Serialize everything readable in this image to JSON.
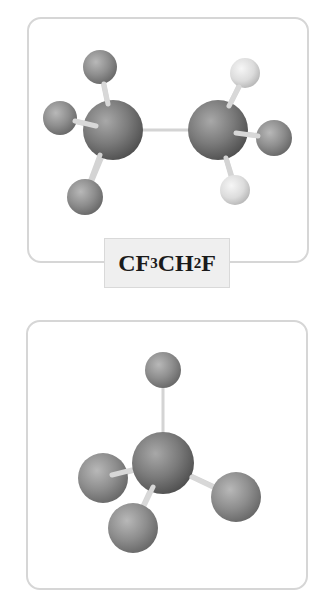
{
  "figure": {
    "panels": [
      {
        "id": "panel1",
        "label": {
          "parts": [
            {
              "text": "CF",
              "sub": "3"
            },
            {
              "text": "CH",
              "sub": "2"
            },
            {
              "text": "F",
              "sub": ""
            }
          ],
          "full_text": "CF3CH2F"
        },
        "molecule": "CF3CH2F",
        "atoms": [
          {
            "element": "C",
            "x": 113,
            "y": 130,
            "r": 30
          },
          {
            "element": "F",
            "x": 100,
            "y": 67,
            "r": 17
          },
          {
            "element": "F",
            "x": 60,
            "y": 118,
            "r": 17
          },
          {
            "element": "F",
            "x": 85,
            "y": 197,
            "r": 18
          },
          {
            "element": "C",
            "x": 218,
            "y": 130,
            "r": 30
          },
          {
            "element": "H",
            "x": 245,
            "y": 73,
            "r": 15
          },
          {
            "element": "F",
            "x": 274,
            "y": 138,
            "r": 18
          },
          {
            "element": "H",
            "x": 235,
            "y": 190,
            "r": 15
          }
        ]
      },
      {
        "id": "panel2",
        "molecule": "CF4",
        "atoms": [
          {
            "element": "F",
            "x": 163,
            "y": 370,
            "r": 18
          },
          {
            "element": "C",
            "x": 163,
            "y": 463,
            "r": 31
          },
          {
            "element": "F",
            "x": 103,
            "y": 478,
            "r": 25
          },
          {
            "element": "F",
            "x": 236,
            "y": 497,
            "r": 25
          },
          {
            "element": "F",
            "x": 133,
            "y": 528,
            "r": 25
          }
        ]
      }
    ],
    "colors": {
      "carbon": "#7a7a7a",
      "fluorine": "#8e8e8e",
      "hydrogen": "#dcdcdc",
      "bond": "#d8d8d8",
      "panel_border": "#d6d6d6",
      "label_bg": "#efefef"
    }
  }
}
